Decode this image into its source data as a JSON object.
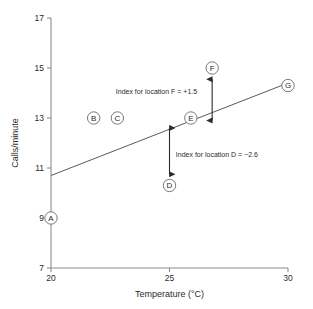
{
  "chart_data": {
    "type": "scatter",
    "title": "",
    "xlabel": "Temperature (°C)",
    "ylabel": "Calls/minute",
    "xlim": [
      20,
      30
    ],
    "ylim": [
      7,
      17
    ],
    "xticks": [
      "20",
      "25",
      "30"
    ],
    "xtick_values": [
      20,
      25,
      30
    ],
    "yticks": [
      "7",
      "9",
      "11",
      "13",
      "15",
      "17"
    ],
    "ytick_values": [
      7,
      9,
      11,
      13,
      15,
      17
    ],
    "grid": false,
    "legend": "none",
    "points": [
      {
        "label": "A",
        "x": 20.0,
        "y": 9.0
      },
      {
        "label": "B",
        "x": 21.8,
        "y": 13.0
      },
      {
        "label": "C",
        "x": 22.8,
        "y": 13.0
      },
      {
        "label": "D",
        "x": 25.0,
        "y": 10.3
      },
      {
        "label": "E",
        "x": 25.9,
        "y": 13.0
      },
      {
        "label": "F",
        "x": 26.8,
        "y": 15.0
      },
      {
        "label": "G",
        "x": 30.0,
        "y": 14.3
      }
    ],
    "fit_line": {
      "x": [
        20,
        30
      ],
      "y": [
        10.7,
        14.4
      ]
    },
    "annotations": [
      {
        "id": "index-f",
        "text": "Index for location F = +1.5",
        "value": 1.5,
        "point": "F",
        "arrow_x": 26.8,
        "arrow_y_from": 12.9,
        "arrow_y_to": 14.55,
        "text_x": 24.45,
        "text_y": 14.05
      },
      {
        "id": "index-d",
        "text": "Index for location D = −2.6",
        "value": -2.6,
        "point": "D",
        "arrow_x": 25.0,
        "arrow_y_from": 12.6,
        "arrow_y_to": 10.75,
        "text_x": 27.0,
        "text_y": 11.55
      }
    ]
  },
  "axes": {
    "x_title": "Temperature (°C)",
    "y_title": "Calls/minute"
  },
  "colors": {
    "axis": "#8c8c8c",
    "fit_line": "#5a5a5a",
    "annotation": "#2b2b2b",
    "marker_stroke": "#6b6b6b",
    "background": "#ffffff"
  }
}
